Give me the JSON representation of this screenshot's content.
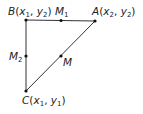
{
  "diagram": {
    "type": "right-triangle-midpoints",
    "colors": {
      "line": "#333333",
      "point": "#111111",
      "text": "#222222",
      "background": "#ffffff"
    },
    "points": {
      "B": {
        "label": "B",
        "x_sub": "1",
        "y_sub": "2",
        "px": 26,
        "py": 20
      },
      "A": {
        "label": "A",
        "x_sub": "2",
        "y_sub": "2",
        "px": 95,
        "py": 21
      },
      "C": {
        "label": "C",
        "x_sub": "1",
        "y_sub": "1",
        "px": 26,
        "py": 91
      },
      "M1": {
        "label": "M",
        "sub": "1",
        "px": 61,
        "py": 20
      },
      "M2": {
        "label": "M",
        "sub": "2",
        "px": 26,
        "py": 56
      },
      "M": {
        "label": "M",
        "px": 61,
        "py": 56
      }
    },
    "segments": [
      {
        "from": "B",
        "to": "A"
      },
      {
        "from": "B",
        "to": "C"
      },
      {
        "from": "C",
        "to": "A"
      }
    ],
    "text": {
      "x": "x",
      "y": "y",
      "comma": ", ",
      "open": "(",
      "close": ")"
    }
  }
}
